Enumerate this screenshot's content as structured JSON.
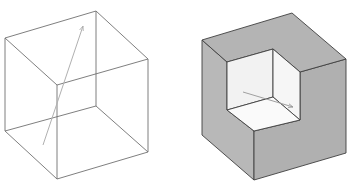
{
  "figure": {
    "left_panel": {
      "description": "wireframe cube with arrow",
      "edge_color": "#707070",
      "arrow_color": "#b0b0b0"
    },
    "right_panel": {
      "description": "solid cube with corner notch removed, inner notch shows arrow",
      "face_color": "#b4b4b4",
      "notch_color": "#f4f4f4",
      "notch_floor_color": "#f8f8f8",
      "edge_color": "#404040",
      "arrow_color": "#a0a0a0"
    }
  }
}
